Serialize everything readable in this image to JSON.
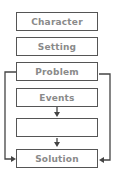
{
  "diagram": {
    "type": "story-map flowchart",
    "boxes": [
      {
        "id": "character",
        "label": "Character"
      },
      {
        "id": "setting",
        "label": "Setting"
      },
      {
        "id": "problem",
        "label": "Problem"
      },
      {
        "id": "events",
        "label": "Events"
      },
      {
        "id": "blank",
        "label": ""
      },
      {
        "id": "solution",
        "label": "Solution"
      }
    ],
    "edges": [
      {
        "from": "events",
        "to": "blank",
        "style": "down-arrow"
      },
      {
        "from": "blank",
        "to": "solution",
        "style": "down-arrow"
      },
      {
        "from": "problem",
        "to": "solution",
        "style": "left-bracket-arrow"
      },
      {
        "from": "problem",
        "to": "solution",
        "style": "right-bracket-arrow"
      }
    ],
    "colors": {
      "border": "#555555",
      "text": "#8a8a8a",
      "background": "#ffffff"
    }
  }
}
